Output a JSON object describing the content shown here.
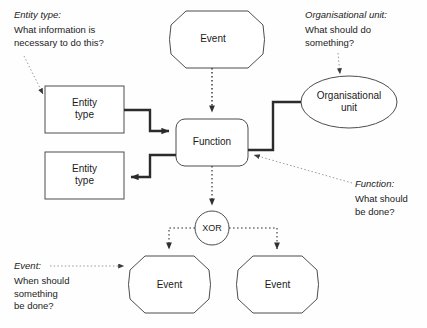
{
  "diagram": {
    "colors": {
      "background": "#fefefe",
      "shape_stroke": "#4d4d4d",
      "text": "#1a1a1a",
      "control_flow": "#2b2b2b",
      "data_flow": "#1a1a1a",
      "leader_line": "#8c8c8c"
    },
    "nodes": [
      {
        "id": "event-top",
        "type": "event",
        "label": "Event"
      },
      {
        "id": "entity-top",
        "type": "entity",
        "label": "Entity\ntype"
      },
      {
        "id": "entity-bottom",
        "type": "entity",
        "label": "Entity\ntype"
      },
      {
        "id": "function",
        "type": "function",
        "label": "Function"
      },
      {
        "id": "org-unit",
        "type": "org",
        "label": "Organisational\nunit"
      },
      {
        "id": "xor",
        "type": "operator",
        "label": "XOR"
      },
      {
        "id": "event-left",
        "type": "event",
        "label": "Event"
      },
      {
        "id": "event-right",
        "type": "event",
        "label": "Event"
      }
    ],
    "annotations": [
      {
        "id": "entity-type-note",
        "heading": "Entity type:",
        "body": "What information is\nnecessary to do this?"
      },
      {
        "id": "org-unit-note",
        "heading": "Organisational unit:",
        "body": "What should do\nsomething?"
      },
      {
        "id": "function-note",
        "heading": "Function:",
        "body": "What should\nbe done?"
      },
      {
        "id": "event-note",
        "heading": "Event:",
        "body": "When should\nsomething\nbe done?"
      }
    ]
  }
}
